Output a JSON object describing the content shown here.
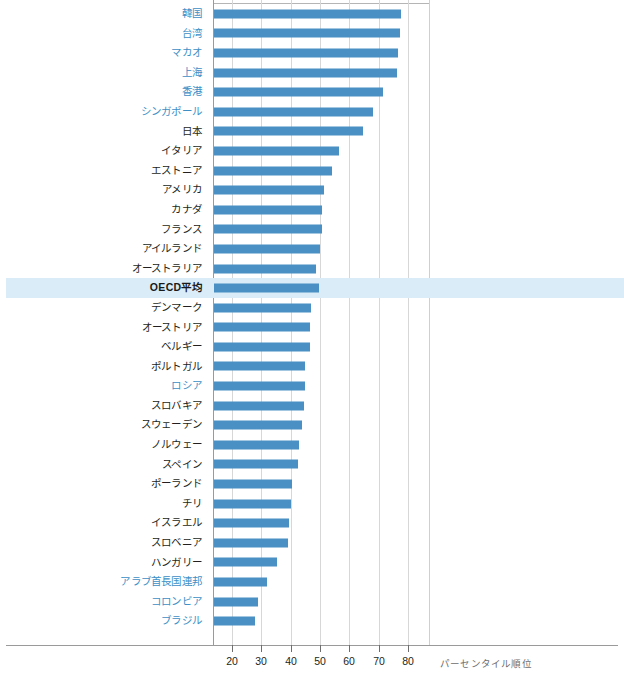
{
  "chart_data": {
    "type": "bar",
    "orientation": "horizontal",
    "title": "",
    "subtitle": "",
    "xlabel": "パーセンタイル順位",
    "ylabel": "",
    "xlim": [
      14,
      87
    ],
    "xticks": [
      20,
      30,
      40,
      50,
      60,
      70,
      80
    ],
    "grid": true,
    "legend": false,
    "bar_color": "#4a90c4",
    "accent_label_color": "#3d8fc6",
    "highlight_row_color": "#d9ecf7",
    "categories": [
      "韓国",
      "台湾",
      "マカオ",
      "上海",
      "香港",
      "シンガポール",
      "日本",
      "イタリア",
      "エストニア",
      "アメリカ",
      "カナダ",
      "フランス",
      "アイルランド",
      "オーストラリア",
      "OECD平均",
      "デンマーク",
      "オーストリア",
      "ベルギー",
      "ポルトガル",
      "ロシア",
      "スロバキア",
      "スウェーデン",
      "ノルウェー",
      "スペイン",
      "ポーランド",
      "チリ",
      "イスラエル",
      "スロベニア",
      "ハンガリー",
      "アラブ首長国連邦",
      "コロンビア",
      "ブラジル"
    ],
    "values": [
      77.5,
      77.0,
      76.5,
      76.0,
      71.5,
      68.0,
      64.5,
      56.5,
      54.0,
      51.5,
      50.5,
      50.5,
      50.0,
      48.5,
      49.5,
      47.0,
      46.5,
      46.5,
      45.0,
      45.0,
      44.5,
      44.0,
      43.0,
      42.5,
      40.5,
      40.0,
      39.5,
      39.0,
      35.5,
      32.0,
      29.0,
      28.0
    ],
    "series": [
      {
        "name": "パーセンタイル順位",
        "values": [
          77.5,
          77.0,
          76.5,
          76.0,
          71.5,
          68.0,
          64.5,
          56.5,
          54.0,
          51.5,
          50.5,
          50.5,
          50.0,
          48.5,
          49.5,
          47.0,
          46.5,
          46.5,
          45.0,
          45.0,
          44.5,
          44.0,
          43.0,
          42.5,
          40.5,
          40.0,
          39.5,
          39.0,
          35.5,
          32.0,
          29.0,
          28.0
        ]
      }
    ],
    "label_styles": [
      "accent",
      "accent",
      "accent",
      "accent",
      "accent",
      "accent",
      "normal",
      "normal",
      "normal",
      "normal",
      "normal",
      "normal",
      "normal",
      "normal",
      "bold",
      "normal",
      "normal",
      "normal",
      "normal",
      "accent",
      "normal",
      "normal",
      "normal",
      "normal",
      "normal",
      "normal",
      "normal",
      "normal",
      "normal",
      "accent",
      "accent",
      "accent"
    ],
    "highlight_index": 14
  }
}
